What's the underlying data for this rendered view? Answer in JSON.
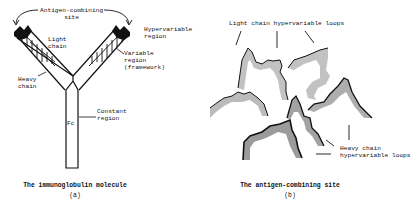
{
  "panel_a": {
    "labels": {
      "antigen_site": "Antigen-combining\nsite",
      "hypervariable": "Hypervariable\nregion",
      "light_chain": "Light\nchain",
      "variable": "Variable\nregion\n(framework)",
      "heavy_chain": "Heavy\nchain",
      "constant": "Constant\nregion",
      "fc": "Fc"
    },
    "caption": "The immunoglobulin molecule",
    "sublabel": "(a)"
  },
  "panel_b": {
    "labels": {
      "light_loops": "Light chain hypervariable loops",
      "heavy_loops": "Heavy chain\nhypervariable loops"
    },
    "caption": "The antigen-combining site",
    "sublabel": "(b)"
  },
  "colors": {
    "ink": "#111111",
    "shade": "#9a9a9a",
    "background": "#ffffff"
  }
}
